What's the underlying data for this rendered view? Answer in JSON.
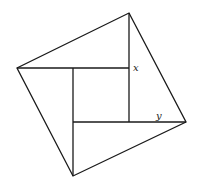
{
  "diagram": {
    "labels": {
      "x": "x",
      "y": "y"
    },
    "colors": {
      "stroke": "#1a1a1a",
      "background": "#ffffff"
    }
  }
}
